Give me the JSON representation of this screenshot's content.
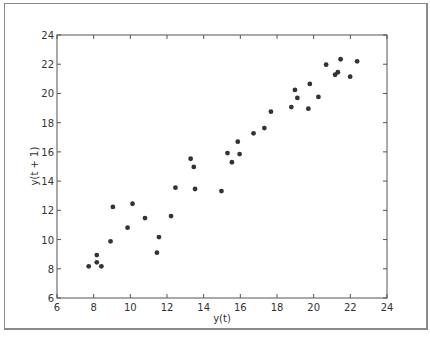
{
  "chart_data": {
    "type": "scatter",
    "title": "",
    "xlabel": "y(t)",
    "ylabel": "y(t + 1)",
    "xlim": [
      6,
      24
    ],
    "ylim": [
      6,
      24
    ],
    "xticks": [
      6,
      8,
      10,
      12,
      14,
      16,
      18,
      20,
      22,
      24
    ],
    "yticks": [
      6,
      8,
      10,
      12,
      14,
      16,
      18,
      20,
      22,
      24
    ],
    "grid": false,
    "legend": null,
    "marker_color": "#333333",
    "series": [
      {
        "name": "lag-1",
        "x": [
          7.73,
          8.17,
          8.17,
          8.42,
          8.92,
          9.05,
          9.85,
          10.12,
          10.8,
          11.45,
          11.56,
          12.22,
          12.46,
          13.29,
          13.46,
          13.53,
          14.97,
          15.3,
          15.54,
          15.86,
          15.96,
          16.72,
          17.31,
          17.67,
          18.78,
          18.98,
          19.11,
          19.71,
          19.79,
          20.26,
          20.68,
          21.17,
          21.32,
          21.47,
          21.99,
          22.37
        ],
        "y": [
          8.17,
          8.44,
          8.94,
          8.17,
          9.88,
          12.23,
          10.81,
          12.45,
          11.47,
          9.1,
          10.17,
          11.61,
          13.55,
          15.53,
          14.97,
          13.46,
          13.32,
          15.92,
          15.29,
          16.7,
          15.85,
          17.27,
          17.63,
          18.75,
          19.07,
          20.24,
          19.69,
          18.96,
          20.65,
          19.76,
          21.97,
          21.28,
          21.45,
          22.34,
          21.15,
          22.2
        ]
      }
    ]
  }
}
